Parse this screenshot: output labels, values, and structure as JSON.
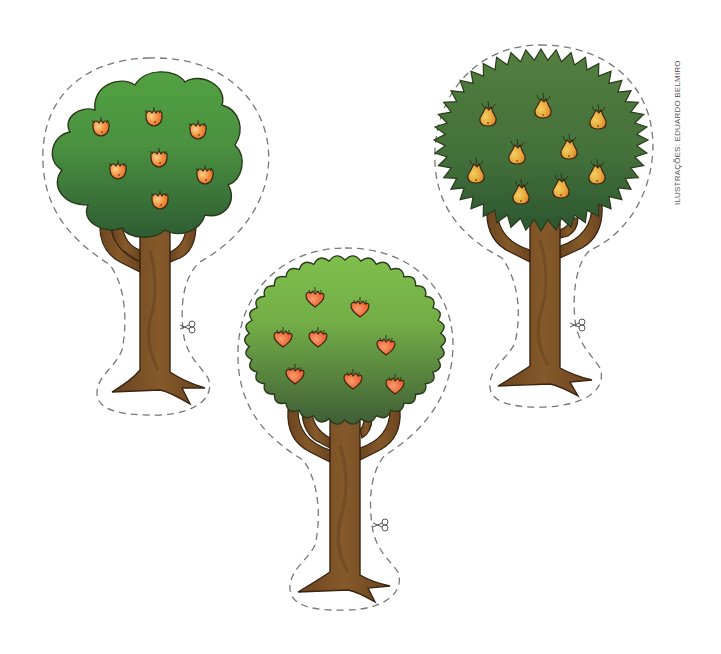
{
  "page": {
    "credit": "ILUSTRAÇÕES: EDUARDO BELMIRO"
  },
  "colors": {
    "background": "#ffffff",
    "cut_line": "#777777",
    "outline": "#2a2a1a",
    "trunk": "#7a5326",
    "trunk_dark": "#5e3f1c",
    "apple_tree_top": "#4f9a3f",
    "apple_tree_bottom": "#2f5f34",
    "peach_tree_top": "#7ab94a",
    "peach_tree_bottom": "#3f5f35",
    "pear_tree_top": "#4e7f3e",
    "pear_tree_bottom": "#2d5a30",
    "apple_fruit": "#f08a3a",
    "heart_fruit": "#f06a3a",
    "pear_fruit": "#e6a23a"
  },
  "trees": [
    {
      "id": "apple-tree",
      "canopy_shape": "cloud",
      "fruit_type": "apple",
      "fruit_count": 7,
      "has_cut_line": true,
      "scissors_icon": "scissors"
    },
    {
      "id": "heart-fruit-tree",
      "canopy_shape": "scalloped-round",
      "fruit_type": "heart-shaped fruit",
      "fruit_count": 8,
      "has_cut_line": true,
      "scissors_icon": "scissors"
    },
    {
      "id": "pear-tree",
      "canopy_shape": "spiky-round",
      "fruit_type": "pear",
      "fruit_count": 9,
      "has_cut_line": true,
      "scissors_icon": "scissors"
    }
  ]
}
